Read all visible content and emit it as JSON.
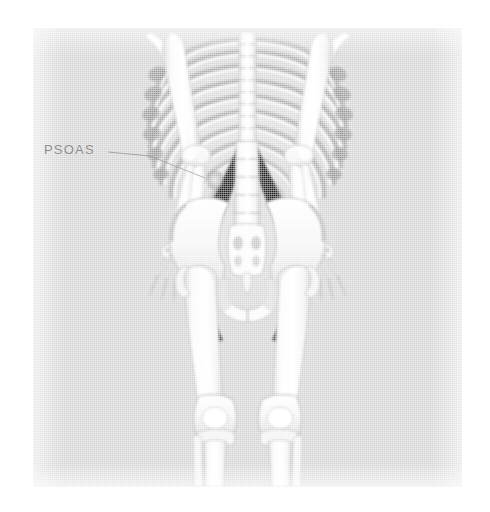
{
  "figure": {
    "kind": "bone-scan-illustration",
    "view": "posterior whole-body",
    "panel": {
      "background_color": "#d2d2d2",
      "page_color": "#ffffff",
      "left": 33,
      "top": 28,
      "width": 429,
      "height": 459
    },
    "annotations": [
      {
        "id": "psoas",
        "label": "PSOAS",
        "text_color": "#8b8b8b",
        "leader_line_color": "#9a9a9a",
        "label_x": 44,
        "label_y": 140,
        "leader_from_x": 108,
        "leader_from_y": 152,
        "leader_to_x": 205,
        "leader_to_y": 178
      }
    ],
    "anatomy": {
      "bone_color": "#f6f6f6",
      "bone_outline_color": "#9f9f9f",
      "muscle_uptake_color": "#2f2f2f",
      "hotspot_color": "#cfcfcf",
      "structures": [
        "rib-cage",
        "thoracic-spine",
        "lumbar-spine",
        "humerus-left",
        "humerus-right",
        "radius-ulna-left",
        "radius-ulna-right",
        "hand-left",
        "hand-right",
        "pelvis",
        "sacrum",
        "femur-left",
        "femur-right",
        "knee-left",
        "knee-right",
        "tibia-fibula-left",
        "tibia-fibula-right",
        "psoas-muscle-left",
        "psoas-muscle-right"
      ]
    }
  }
}
